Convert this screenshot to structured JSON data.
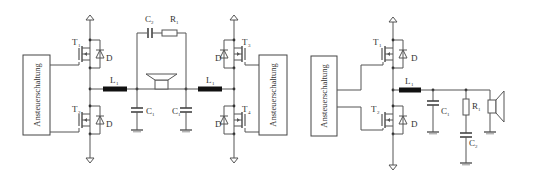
{
  "figure": {
    "left_circuit": {
      "name": "Full-bridge (BTL) output stage",
      "driver_left": "Ansteuerschaltung",
      "driver_right": "Ansteuerschaltung",
      "transistors": [
        {
          "name": "T",
          "sub": "1"
        },
        {
          "name": "T",
          "sub": "2"
        },
        {
          "name": "T",
          "sub": "3"
        },
        {
          "name": "T",
          "sub": "4"
        }
      ],
      "diode_label": "D",
      "inductor_left": {
        "name": "L",
        "sub": "1"
      },
      "inductor_right": {
        "name": "L",
        "sub": "1"
      },
      "cap_left": {
        "name": "C",
        "sub": "1"
      },
      "cap_right": {
        "name": "C",
        "sub": "1"
      },
      "zobel_cap": {
        "name": "C",
        "sub": "2"
      },
      "zobel_res": {
        "name": "R",
        "sub": "1"
      }
    },
    "right_circuit": {
      "name": "Half-bridge output stage",
      "driver": "Ansteuerschaltung",
      "transistors": [
        {
          "name": "T",
          "sub": "1"
        },
        {
          "name": "T",
          "sub": "2"
        }
      ],
      "diode_label": "D",
      "inductor": {
        "name": "L",
        "sub": "1"
      },
      "cap": {
        "name": "C",
        "sub": "1"
      },
      "zobel_res": {
        "name": "R",
        "sub": "1"
      },
      "zobel_cap": {
        "name": "C",
        "sub": "2"
      }
    }
  }
}
